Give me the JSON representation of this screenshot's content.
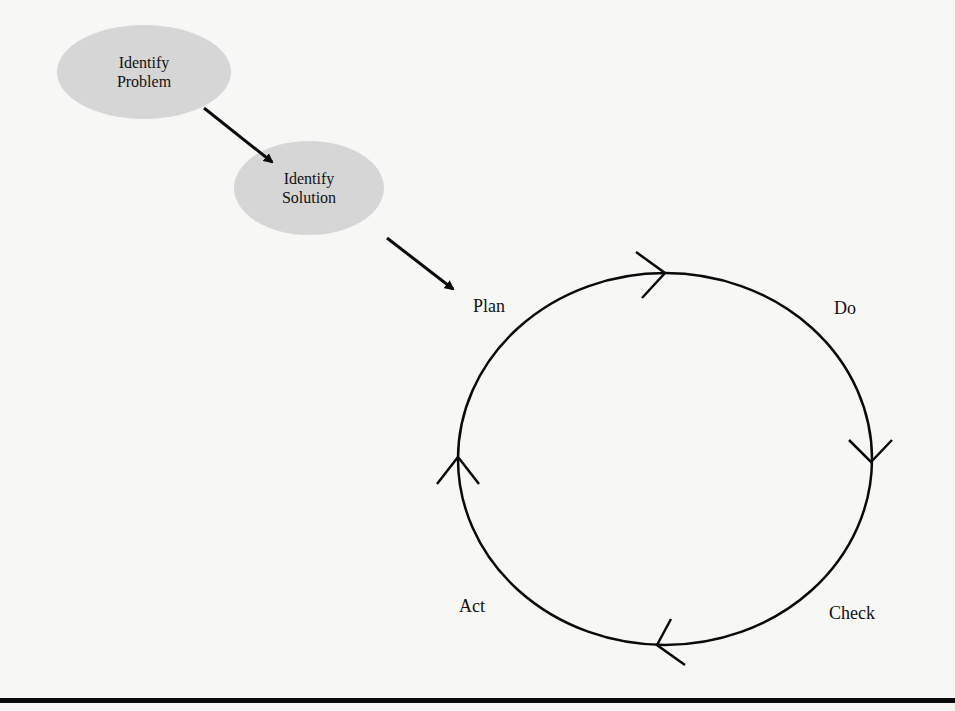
{
  "diagram": {
    "type": "flow-to-cycle",
    "colors": {
      "background": "#f7f7f5",
      "node_fill": "#d6d6d6",
      "stroke": "#0a0a0a",
      "text": "#111111"
    },
    "nodes": [
      {
        "id": "identify-problem",
        "line1": "Identify",
        "line2": "Problem"
      },
      {
        "id": "identify-solution",
        "line1": "Identify",
        "line2": "Solution"
      }
    ],
    "edges": [
      {
        "from": "identify-problem",
        "to": "identify-solution"
      },
      {
        "from": "identify-solution",
        "to": "plan"
      }
    ],
    "cycle": {
      "direction": "clockwise",
      "stages": [
        {
          "id": "plan",
          "label": "Plan"
        },
        {
          "id": "do",
          "label": "Do"
        },
        {
          "id": "check",
          "label": "Check"
        },
        {
          "id": "act",
          "label": "Act"
        }
      ]
    }
  }
}
